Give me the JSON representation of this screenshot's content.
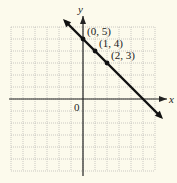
{
  "chart_data": {
    "type": "line",
    "title": "",
    "xlabel": "x",
    "ylabel": "y",
    "xlim": [
      -6,
      6
    ],
    "ylim": [
      -6,
      6
    ],
    "grid": true,
    "origin_label": "0",
    "series": [
      {
        "name": "y = -x + 5",
        "x": [
          -1.5,
          6.5
        ],
        "y": [
          6.5,
          -1.5
        ],
        "color": "#111111"
      }
    ],
    "points": [
      {
        "x": 0,
        "y": 5,
        "label": "(0, 5)"
      },
      {
        "x": 1,
        "y": 4,
        "label": "(1, 4)"
      },
      {
        "x": 2,
        "y": 3,
        "label": "(2, 3)"
      }
    ]
  },
  "colors": {
    "background": "#fcfaec",
    "grid": "#a8a8a8",
    "axis": "#222222",
    "line": "#111111"
  }
}
